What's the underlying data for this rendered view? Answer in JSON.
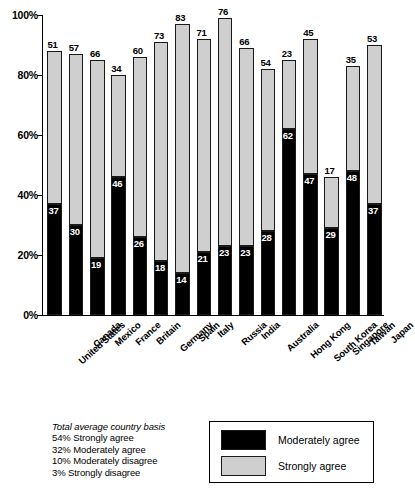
{
  "chart_data": {
    "type": "bar",
    "subtype": "stacked-column",
    "title": "",
    "xlabel": "",
    "ylabel": "",
    "ylim": [
      0,
      100
    ],
    "yticks": [
      "0%",
      "20%",
      "40%",
      "60%",
      "80%",
      "100%"
    ],
    "ytick_values": [
      0,
      20,
      40,
      60,
      80,
      100
    ],
    "grid": false,
    "legend_position": "bottom-right",
    "categories": [
      "United States",
      "Canada",
      "Mexico",
      "France",
      "Britain",
      "Germany",
      "Spain",
      "Italy",
      "Russia",
      "India",
      "Australia",
      "Hong Kong",
      "South Korea",
      "Singapore",
      "Taiwan",
      "Japan"
    ],
    "series": [
      {
        "name": "Moderately agree",
        "color": "#000000",
        "values": [
          37,
          30,
          19,
          46,
          26,
          18,
          14,
          21,
          23,
          23,
          28,
          62,
          47,
          29,
          48,
          37
        ]
      },
      {
        "name": "Strongly agree",
        "color": "#cfcfcf",
        "values": [
          51,
          57,
          66,
          34,
          60,
          73,
          83,
          71,
          76,
          66,
          54,
          23,
          45,
          17,
          35,
          53
        ]
      }
    ],
    "totals": [
      88,
      87,
      85,
      80,
      86,
      91,
      97,
      92,
      99,
      89,
      82,
      85,
      92,
      46,
      83,
      90
    ]
  },
  "legend": {
    "entries": [
      {
        "label": "Moderately agree",
        "color": "#000000"
      },
      {
        "label": "Strongly agree",
        "color": "#cfcfcf"
      }
    ]
  },
  "footnote": {
    "title": "Total average country basis",
    "lines": [
      "54% Strongly agree",
      "32% Moderately agree",
      "10% Moderately disagree",
      "3% Strongly disagree"
    ]
  },
  "source": ""
}
